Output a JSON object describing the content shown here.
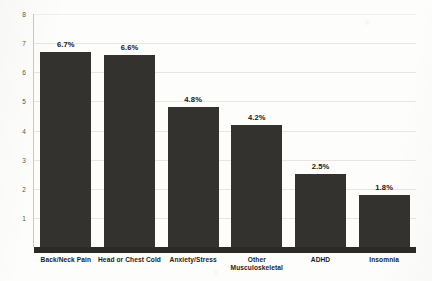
{
  "chart_data": {
    "type": "bar",
    "title": "",
    "subtitle": "",
    "xlabel": "",
    "ylabel": "",
    "categories": [
      "Back/Neck Pain",
      "Head or Chest Cold",
      "Anxiety/Stress",
      "Other\nMusculoskeletal",
      "ADHD",
      "Insomnia"
    ],
    "values": [
      6.7,
      6.6,
      4.8,
      4.2,
      2.5,
      1.8
    ],
    "data_labels": [
      "6.7%",
      "6.6%",
      "4.8%",
      "4.2%",
      "2.5%",
      "1.8%"
    ],
    "ylim": [
      0,
      8
    ],
    "yticks": [
      8,
      7,
      6,
      5,
      4,
      3,
      2,
      1
    ],
    "ytick_labels": [
      "8",
      "7",
      "6",
      "5",
      "4",
      "3",
      "2",
      "1"
    ],
    "grid": true,
    "legend": null,
    "bar_color": "#33322f",
    "gridline_color": "#e6e6e3",
    "axis_color": "#c9c9c6",
    "label_color": "#17171a",
    "background": "#fdfdfc"
  }
}
